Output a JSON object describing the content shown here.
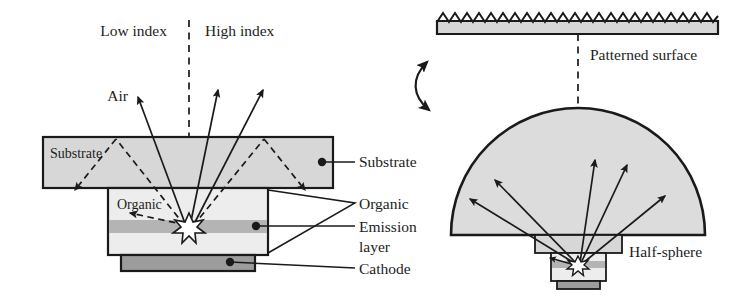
{
  "figure": {
    "background": "#ffffff",
    "stroke": "#1a1a1a"
  },
  "colors": {
    "substrate_fill": "#d7d7d7",
    "organic_fill": "#ededed",
    "emission_fill": "#b4b4b4",
    "cathode_fill": "#9c9c9c",
    "halfsphere_fill": "#dcdcdc",
    "patterned_fill": "#d7d7d7",
    "line": "#1a1a1a",
    "text": "#1d1d1d",
    "star_fill": "#ffffff"
  },
  "left_panel": {
    "name": "flat-substrate-oled",
    "headers": {
      "low_index": "Low index",
      "high_index": "High index"
    },
    "axis": {
      "label": "optical-axis",
      "style": "dashed-vertical"
    },
    "air_label": "Air",
    "inner_labels": {
      "substrate": "Substrate",
      "organic": "Organic"
    },
    "callouts": [
      {
        "id": "substrate",
        "label": "Substrate"
      },
      {
        "id": "organic",
        "label": "Organic"
      },
      {
        "id": "emission",
        "label": "Emission"
      },
      {
        "id": "emission2",
        "label": "layer"
      },
      {
        "id": "cathode",
        "label": "Cathode"
      }
    ],
    "layers": [
      {
        "name": "substrate",
        "fill": "#d7d7d7"
      },
      {
        "name": "organic",
        "fill": "#ededed"
      },
      {
        "name": "emission-layer",
        "fill": "#b4b4b4"
      },
      {
        "name": "cathode",
        "fill": "#9c9c9c"
      }
    ],
    "escaping_rays": 3,
    "trapped_rays": 5
  },
  "right_panel": {
    "name": "half-sphere-oled",
    "patterned_surface_label": "Patterned surface",
    "half_sphere_label": "Half-sphere",
    "axis": {
      "label": "optical-axis",
      "style": "dashed-vertical"
    },
    "escaping_rays": 5,
    "swap_arrow": "double-headed-curved-arrow"
  }
}
